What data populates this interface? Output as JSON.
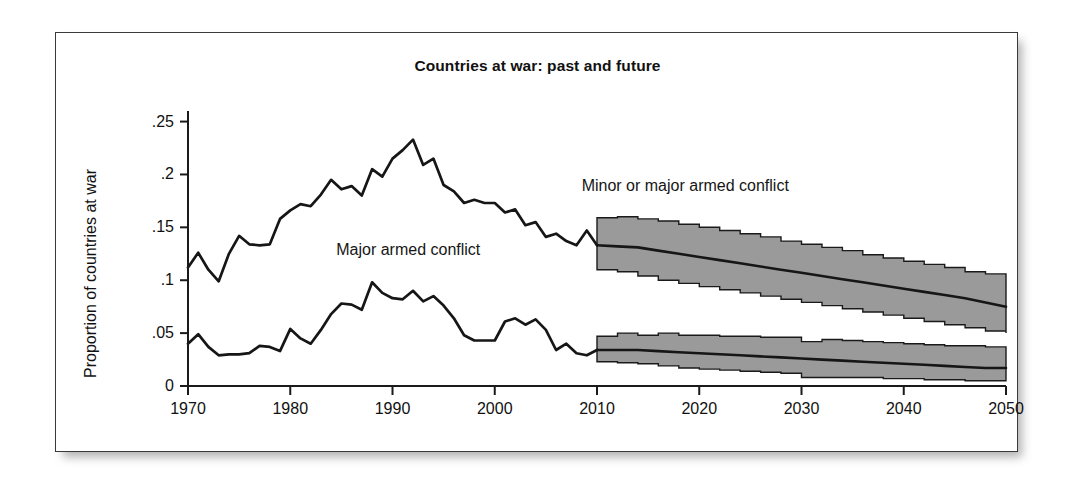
{
  "figure": {
    "title": "Countries at war: past and future",
    "y_axis_title": "Proportion of countries at war",
    "annotations": {
      "upper": "Minor or major armed conflict",
      "lower": "Major armed conflict"
    }
  },
  "chart_data": {
    "type": "line",
    "title": "Countries at war: past and future",
    "xlabel": "",
    "ylabel": "Proportion of countries at war",
    "xlim": [
      1970,
      2050
    ],
    "ylim": [
      0,
      0.26
    ],
    "grid": false,
    "legend": "inline-annotations",
    "colors": {
      "line": "#161616",
      "band_fill": "#9a9a9a",
      "band_stroke": "#1a1a1a",
      "frame": "#3a3a3a",
      "background": "#ffffff"
    },
    "x_ticks": [
      1970,
      1980,
      1990,
      2000,
      2010,
      2020,
      2030,
      2040,
      2050
    ],
    "x_tick_labels": [
      "1970",
      "1980",
      "1990",
      "2000",
      "2010",
      "2020",
      "2030",
      "2040",
      "2050"
    ],
    "y_ticks": [
      0,
      0.05,
      0.1,
      0.15,
      0.2,
      0.25
    ],
    "y_tick_labels": [
      "0",
      ".05",
      ".1",
      ".15",
      ".2",
      ".25"
    ],
    "forecast_start_year": 2010,
    "series": [
      {
        "name": "Minor or major armed conflict",
        "kind": "historical",
        "x": [
          1970,
          1971,
          1972,
          1973,
          1974,
          1975,
          1976,
          1977,
          1978,
          1979,
          1980,
          1981,
          1982,
          1983,
          1984,
          1985,
          1986,
          1987,
          1988,
          1989,
          1990,
          1991,
          1992,
          1993,
          1994,
          1995,
          1996,
          1997,
          1998,
          1999,
          2000,
          2001,
          2002,
          2003,
          2004,
          2005,
          2006,
          2007,
          2008,
          2009,
          2010
        ],
        "values": [
          0.112,
          0.126,
          0.11,
          0.099,
          0.125,
          0.142,
          0.134,
          0.133,
          0.134,
          0.158,
          0.166,
          0.172,
          0.17,
          0.181,
          0.195,
          0.186,
          0.189,
          0.18,
          0.205,
          0.198,
          0.215,
          0.223,
          0.233,
          0.209,
          0.215,
          0.19,
          0.184,
          0.173,
          0.176,
          0.173,
          0.173,
          0.164,
          0.167,
          0.152,
          0.155,
          0.141,
          0.144,
          0.137,
          0.133,
          0.147,
          0.133
        ]
      },
      {
        "name": "Major armed conflict",
        "kind": "historical",
        "x": [
          1970,
          1971,
          1972,
          1973,
          1974,
          1975,
          1976,
          1977,
          1978,
          1979,
          1980,
          1981,
          1982,
          1983,
          1984,
          1985,
          1986,
          1987,
          1988,
          1989,
          1990,
          1991,
          1992,
          1993,
          1994,
          1995,
          1996,
          1997,
          1998,
          1999,
          2000,
          2001,
          2002,
          2003,
          2004,
          2005,
          2006,
          2007,
          2008,
          2009,
          2010
        ],
        "values": [
          0.04,
          0.049,
          0.037,
          0.029,
          0.03,
          0.03,
          0.031,
          0.038,
          0.037,
          0.033,
          0.054,
          0.045,
          0.04,
          0.053,
          0.068,
          0.078,
          0.077,
          0.072,
          0.098,
          0.088,
          0.083,
          0.082,
          0.09,
          0.08,
          0.085,
          0.076,
          0.064,
          0.048,
          0.043,
          0.043,
          0.043,
          0.061,
          0.064,
          0.058,
          0.063,
          0.053,
          0.034,
          0.04,
          0.031,
          0.029,
          0.034
        ]
      },
      {
        "name": "Minor or major armed conflict",
        "kind": "forecast",
        "x": [
          2010,
          2012,
          2014,
          2016,
          2018,
          2020,
          2022,
          2024,
          2026,
          2028,
          2030,
          2032,
          2034,
          2036,
          2038,
          2040,
          2042,
          2044,
          2046,
          2048,
          2050
        ],
        "values": [
          0.133,
          0.132,
          0.131,
          0.128,
          0.125,
          0.122,
          0.119,
          0.116,
          0.113,
          0.11,
          0.107,
          0.104,
          0.101,
          0.098,
          0.095,
          0.092,
          0.089,
          0.086,
          0.083,
          0.079,
          0.075
        ],
        "band_upper": [
          0.159,
          0.16,
          0.158,
          0.156,
          0.153,
          0.15,
          0.147,
          0.144,
          0.141,
          0.137,
          0.134,
          0.131,
          0.128,
          0.124,
          0.121,
          0.118,
          0.115,
          0.112,
          0.108,
          0.106,
          0.105
        ],
        "band_lower": [
          0.11,
          0.108,
          0.104,
          0.1,
          0.097,
          0.094,
          0.091,
          0.088,
          0.085,
          0.082,
          0.079,
          0.076,
          0.073,
          0.07,
          0.067,
          0.064,
          0.061,
          0.058,
          0.055,
          0.052,
          0.05
        ]
      },
      {
        "name": "Major armed conflict",
        "kind": "forecast",
        "x": [
          2010,
          2012,
          2014,
          2016,
          2018,
          2020,
          2022,
          2024,
          2026,
          2028,
          2030,
          2032,
          2034,
          2036,
          2038,
          2040,
          2042,
          2044,
          2046,
          2048,
          2050
        ],
        "values": [
          0.034,
          0.034,
          0.034,
          0.033,
          0.032,
          0.031,
          0.03,
          0.029,
          0.028,
          0.027,
          0.026,
          0.025,
          0.024,
          0.023,
          0.022,
          0.021,
          0.02,
          0.019,
          0.018,
          0.017,
          0.017
        ],
        "band_upper": [
          0.047,
          0.05,
          0.048,
          0.05,
          0.048,
          0.048,
          0.047,
          0.047,
          0.046,
          0.046,
          0.042,
          0.044,
          0.043,
          0.042,
          0.041,
          0.04,
          0.039,
          0.038,
          0.038,
          0.037,
          0.037
        ],
        "band_lower": [
          0.023,
          0.022,
          0.021,
          0.019,
          0.017,
          0.016,
          0.015,
          0.014,
          0.013,
          0.012,
          0.008,
          0.008,
          0.008,
          0.008,
          0.007,
          0.007,
          0.006,
          0.006,
          0.005,
          0.005,
          0.005
        ]
      }
    ]
  }
}
